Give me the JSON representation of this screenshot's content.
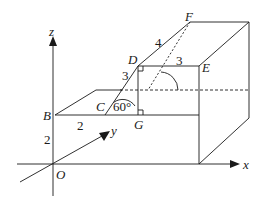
{
  "diagram": {
    "axes": {
      "x_label": "x",
      "y_label": "y",
      "z_label": "z",
      "origin_label": "O"
    },
    "points": {
      "B": "B",
      "C": "C",
      "D": "D",
      "E": "E",
      "F": "F",
      "G": "G"
    },
    "measurements": {
      "OB": "2",
      "BC": "2",
      "CD": "3",
      "DF": "4",
      "DE": "3",
      "angle_DCG": "60°"
    },
    "colors": {
      "line": "#1a1a1a",
      "background": "#ffffff"
    }
  }
}
